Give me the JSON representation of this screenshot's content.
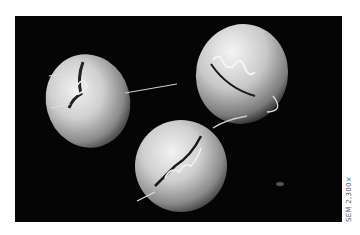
{
  "figure": {
    "background_color": "#050505",
    "cell_color": "#d8d8d8",
    "caption": "SEM 2,300×"
  }
}
